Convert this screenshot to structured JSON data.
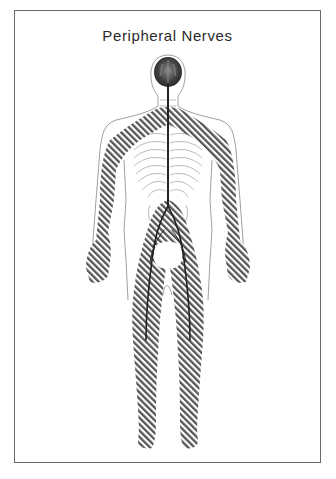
{
  "diagram": {
    "title": "Peripheral Nerves",
    "regions": [
      {
        "name": "brain",
        "style": "shaded dark gray"
      },
      {
        "name": "spinal-cord",
        "style": "dark line"
      },
      {
        "name": "peripheral-nerve-region-arms",
        "style": "diagonal hatching"
      },
      {
        "name": "peripheral-nerve-region-legs",
        "style": "diagonal hatching"
      },
      {
        "name": "ribs",
        "style": "light gray lines"
      },
      {
        "name": "body-outline",
        "style": "thin gray line"
      }
    ],
    "colors": {
      "frame": "#6a6a6a",
      "outline": "#9a9a9a",
      "hatch": "#555555",
      "brain": "#3c3c3c",
      "nerve": "#222222",
      "rib": "#b8b8b8"
    }
  }
}
